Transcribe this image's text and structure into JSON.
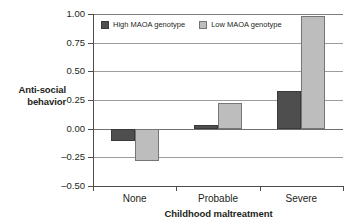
{
  "chart_data": {
    "type": "bar",
    "title": "",
    "xlabel": "Childhood maltreatment",
    "ylabel": "Anti-social behavior",
    "categories": [
      "None",
      "Probable",
      "Severe"
    ],
    "series": [
      {
        "name": "High MAOA genotype",
        "color": "#4e4e4e",
        "values": [
          -0.11,
          0.03,
          0.33
        ]
      },
      {
        "name": "Low MAOA genotype",
        "color": "#bdbdbd",
        "values": [
          -0.28,
          0.22,
          0.98
        ]
      }
    ],
    "ylim": [
      -0.5,
      1.0
    ],
    "yticks": [
      "1.00",
      "0.75",
      "0.50",
      "0.25",
      "0.00",
      "-0.25",
      "-0.50"
    ],
    "ytick_values": [
      1.0,
      0.75,
      0.5,
      0.25,
      0.0,
      -0.25,
      -0.5
    ],
    "grid": true,
    "legend_position": "top-left"
  },
  "axes": {
    "y_title_line1": "Anti-social",
    "y_title_line2": "behavior",
    "x_title": "Childhood maltreatment"
  },
  "legend": {
    "items": [
      {
        "label": "High MAOA genotype"
      },
      {
        "label": "Low MAOA genotype"
      }
    ]
  }
}
